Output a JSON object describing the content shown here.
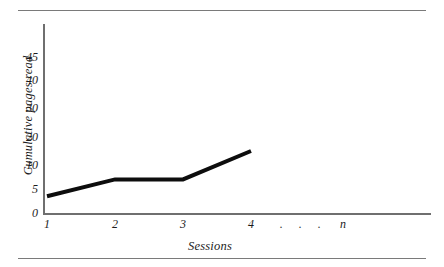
{
  "figure": {
    "has_top_rule": true,
    "has_bottom_rule": true,
    "rule_color": "#7a7a7a",
    "background": "#ffffff"
  },
  "chart_data": {
    "type": "line",
    "title": "",
    "xlabel": "Sessions",
    "ylabel": "Cumulative pages read",
    "categories": [
      "1",
      "2",
      "3",
      "4"
    ],
    "x_tick_labels": [
      "1",
      "2",
      "3",
      "4",
      ".",
      ".",
      ".",
      "n"
    ],
    "x_continues": true,
    "x_continuation_label": "n",
    "y_tick_labels": [
      "0",
      "5",
      "10",
      "20",
      "30",
      "40",
      "45"
    ],
    "y_tick_values": [
      0,
      5,
      10,
      20,
      30,
      40,
      45
    ],
    "y_axis_scale": "non-linear (5-unit steps below 10, 10-unit steps above)",
    "ylim": [
      0,
      48
    ],
    "grid": false,
    "legend": false,
    "series": [
      {
        "name": "Cumulative pages read",
        "color": "#0d0d0d",
        "line_width": 4,
        "x": [
          1,
          2,
          3,
          4
        ],
        "values": [
          3.5,
          7,
          7,
          15
        ]
      }
    ]
  },
  "axes": {
    "y_axis_color": "#6f6f6f",
    "x_axis_color": "#6f6f6f"
  }
}
